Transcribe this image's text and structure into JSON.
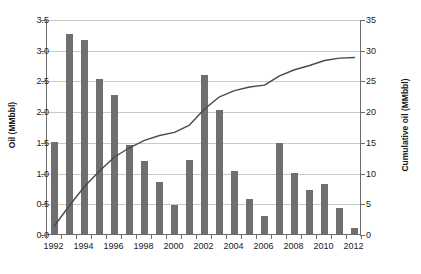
{
  "chart_data": {
    "type": "bar",
    "title": "",
    "subtitle": "",
    "xlabel": "",
    "ylabel": "Oil (MMbbl)",
    "y2label": "Cumulative oil (MMbbl)",
    "grid": true,
    "legend": "none",
    "categories": [
      1992,
      1993,
      1994,
      1995,
      1996,
      1997,
      1998,
      1999,
      2000,
      2001,
      2002,
      2003,
      2004,
      2005,
      2006,
      2007,
      2008,
      2009,
      2010,
      2011,
      2012
    ],
    "xlim": [
      1991.5,
      2012.5
    ],
    "ylim": [
      0,
      3.5
    ],
    "y2lim": [
      0,
      35
    ],
    "ytick_labels": [
      "0.0",
      "0.5",
      "1.0",
      "1.5",
      "2.0",
      "2.5",
      "3.0",
      "3.5"
    ],
    "ytick_values": [
      0,
      0.5,
      1.0,
      1.5,
      2.0,
      2.5,
      3.0,
      3.5
    ],
    "y2tick_labels": [
      "0",
      "5",
      "10",
      "15",
      "20",
      "25",
      "30",
      "35"
    ],
    "y2tick_values": [
      0,
      5,
      10,
      15,
      20,
      25,
      30,
      35
    ],
    "xtick_labels": [
      "1992",
      "1994",
      "1996",
      "1998",
      "2000",
      "2002",
      "2004",
      "2006",
      "2008",
      "2010",
      "2012"
    ],
    "xtick_values": [
      1992,
      1994,
      1996,
      1998,
      2000,
      2002,
      2004,
      2006,
      2008,
      2010,
      2012
    ],
    "series": [
      {
        "name": "Oil (MMbbl)",
        "type": "bar",
        "axis": "left",
        "color": "#6f6f6f",
        "values": [
          1.5,
          3.25,
          3.16,
          2.53,
          2.27,
          1.45,
          1.19,
          0.84,
          0.47,
          1.2,
          2.59,
          2.02,
          1.02,
          0.57,
          0.3,
          1.48,
          1.0,
          0.72,
          0.82,
          0.42,
          0.1
        ]
      },
      {
        "name": "Cumulative oil (MMbbl)",
        "type": "line",
        "axis": "right",
        "color": "#4a4a4a",
        "values": [
          1.5,
          4.8,
          7.9,
          10.4,
          12.7,
          14.2,
          15.4,
          16.2,
          16.7,
          17.9,
          20.5,
          22.5,
          23.5,
          24.1,
          24.4,
          25.9,
          26.9,
          27.6,
          28.4,
          28.8,
          28.9
        ]
      }
    ]
  },
  "axes": {
    "left_title": "Oil (MMbbl)",
    "right_title": "Cumulative oil (MMbbl)"
  }
}
